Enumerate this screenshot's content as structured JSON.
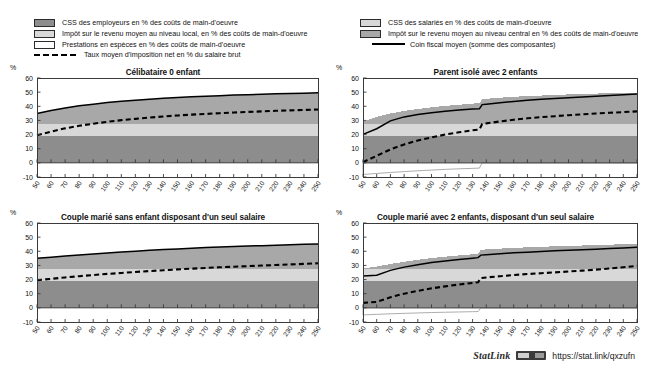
{
  "legend_left": {
    "items": [
      {
        "key": "dark-gray-swatch",
        "label": "CSS des employeurs en % des coûts de main-d'oeuvre"
      },
      {
        "key": "light-gray-swatch",
        "label": "Impôt sur le revenu moyen au niveau local, en % des coûts de main-d'oeuvre"
      },
      {
        "key": "white-swatch",
        "label": "Prestations en espèces en % des coûts de main-d'oeuvre"
      },
      {
        "key": "dashed-line",
        "label": "Taux moyen d'imposition net en % du salaire brut"
      }
    ]
  },
  "legend_right": {
    "items": [
      {
        "key": "light-gray-swatch",
        "label": "CSS des salariés en % des coûts de main-d'oeuvre"
      },
      {
        "key": "mid-gray-swatch",
        "label": "Impôt sur le revenu moyen au niveau central en %  des coûts de main-d'oeuvre"
      },
      {
        "key": "solid-line",
        "label": "Coin fiscal moyen (somme des composantes)"
      }
    ]
  },
  "footer": {
    "statlink_label": "StatLink",
    "url": "https://stat.link/qxzufn"
  },
  "colors": {
    "employer_ssc": "#8d8d8d",
    "central_income_tax": "#a8a8a8",
    "local_income_tax": "#d8d8d8",
    "employee_ssc": "#d8d8d8",
    "cash_benefits": "#ffffff",
    "net_tax_rate_line": "#000000",
    "tax_wedge_line": "#000000",
    "axis": "#3a3a3a"
  },
  "chart_data": [
    {
      "type": "area",
      "panel": "top-left",
      "title": "Célibataire 0 enfant",
      "xlabel": "",
      "ylabel": "%",
      "xlim": [
        50,
        250
      ],
      "ylim": [
        -10,
        60
      ],
      "ytick_values": [
        60,
        50,
        40,
        30,
        20,
        10,
        0,
        -10
      ],
      "x": [
        50,
        60,
        70,
        80,
        90,
        100,
        110,
        120,
        130,
        140,
        150,
        160,
        170,
        180,
        190,
        200,
        210,
        220,
        230,
        240,
        250
      ],
      "grid": false,
      "legend_position": "top",
      "series": [
        {
          "name": "CSS des employeurs en % des coûts de main-d'oeuvre",
          "values": [
            19.1,
            19.1,
            19.1,
            19.1,
            19.1,
            19.1,
            19.1,
            19.1,
            19.1,
            19.1,
            19.1,
            19.1,
            19.1,
            19.1,
            19.1,
            19.1,
            19.1,
            19.1,
            19.1,
            19.1,
            19.1
          ]
        },
        {
          "name": "CSS des salariés en % des coûts de main-d'oeuvre",
          "values": [
            8.3,
            8.3,
            8.3,
            8.3,
            8.3,
            8.3,
            8.3,
            8.3,
            8.3,
            8.3,
            8.3,
            8.3,
            8.3,
            8.3,
            8.3,
            8.3,
            8.3,
            8.3,
            8.3,
            8.3,
            8.3
          ]
        },
        {
          "name": "Impôt sur le revenu moyen au niveau central en % des coûts de main-d'oeuvre",
          "values": [
            7.5,
            9.6,
            11.4,
            12.9,
            14.1,
            15.2,
            16.1,
            16.9,
            17.6,
            18.2,
            18.8,
            19.3,
            19.7,
            20.1,
            20.5,
            20.8,
            21.1,
            21.4,
            21.7,
            21.9,
            22.1
          ]
        },
        {
          "name": "Impôt sur le revenu moyen au niveau local, en % des coûts de main-d'oeuvre",
          "values": [
            0,
            0,
            0,
            0,
            0,
            0,
            0,
            0,
            0,
            0,
            0,
            0,
            0,
            0,
            0,
            0,
            0,
            0,
            0,
            0,
            0
          ]
        },
        {
          "name": "Prestations en espèces en % des coûts de main-d'oeuvre",
          "values": [
            0,
            0,
            0,
            0,
            0,
            0,
            0,
            0,
            0,
            0,
            0,
            0,
            0,
            0,
            0,
            0,
            0,
            0,
            0,
            0,
            0
          ]
        }
      ],
      "lines": [
        {
          "name": "Coin fiscal moyen (somme des composantes)",
          "style": "solid",
          "values": [
            34.9,
            37.0,
            38.8,
            40.3,
            41.5,
            42.6,
            43.5,
            44.3,
            45.0,
            45.6,
            46.2,
            46.7,
            47.1,
            47.5,
            47.9,
            48.2,
            48.5,
            48.8,
            49.1,
            49.3,
            49.5
          ]
        },
        {
          "name": "Taux moyen d'imposition net en % du salaire brut",
          "style": "dashed",
          "values": [
            19.5,
            22.1,
            24.4,
            26.2,
            27.7,
            29.0,
            30.2,
            31.1,
            32.0,
            32.8,
            33.5,
            34.1,
            34.6,
            35.1,
            35.6,
            36.0,
            36.4,
            36.8,
            37.1,
            37.4,
            37.7
          ]
        }
      ]
    },
    {
      "type": "area",
      "panel": "top-right",
      "title": "Parent isolé avec 2 enfants",
      "xlabel": "",
      "ylabel": "%",
      "xlim": [
        50,
        250
      ],
      "ylim": [
        -10,
        60
      ],
      "ytick_values": [
        60,
        50,
        40,
        30,
        20,
        10,
        0,
        -10
      ],
      "x": [
        50,
        60,
        70,
        80,
        90,
        100,
        110,
        120,
        130,
        135,
        137,
        140,
        150,
        160,
        170,
        180,
        190,
        200,
        210,
        220,
        230,
        240,
        250
      ],
      "grid": false,
      "legend_position": "top",
      "series": [
        {
          "name": "CSS des employeurs en % des coûts de main-d'oeuvre",
          "values": [
            19.1,
            19.1,
            19.1,
            19.1,
            19.1,
            19.1,
            19.1,
            19.1,
            19.1,
            19.1,
            19.1,
            19.1,
            19.1,
            19.1,
            19.1,
            19.1,
            19.1,
            19.1,
            19.1,
            19.1,
            19.1,
            19.1,
            19.1
          ]
        },
        {
          "name": "CSS des salariés en % des coûts de main-d'oeuvre",
          "values": [
            8.3,
            8.3,
            8.3,
            8.3,
            8.3,
            8.3,
            8.3,
            8.3,
            8.3,
            8.3,
            8.3,
            8.3,
            8.3,
            8.3,
            8.3,
            8.3,
            8.3,
            8.3,
            8.3,
            8.3,
            8.3,
            8.3,
            8.3
          ]
        },
        {
          "name": "Impôt sur le revenu moyen au niveau central en % des coûts de main-d'oeuvre",
          "values": [
            1.6,
            5.2,
            7.5,
            9.3,
            10.7,
            11.9,
            12.9,
            13.7,
            14.5,
            14.8,
            17.5,
            17.9,
            18.7,
            19.3,
            19.8,
            20.2,
            20.6,
            21.0,
            21.3,
            21.6,
            21.8,
            22.0,
            22.2
          ]
        },
        {
          "name": "Impôt sur le revenu moyen au niveau local, en % des coûts de main-d'oeuvre",
          "values": [
            0,
            0,
            0,
            0,
            0,
            0,
            0,
            0,
            0,
            0,
            0,
            0,
            0,
            0,
            0,
            0,
            0,
            0,
            0,
            0,
            0,
            0,
            0
          ]
        },
        {
          "name": "Prestations en espèces en % des coûts de main-d'oeuvre",
          "values": [
            -8.2,
            -7.5,
            -6.8,
            -6.2,
            -5.6,
            -5.1,
            -4.6,
            -4.2,
            -3.9,
            -3.7,
            0,
            0,
            0,
            0,
            0,
            0,
            0,
            0,
            0,
            0,
            0,
            0,
            0
          ]
        }
      ],
      "lines": [
        {
          "name": "Coin fiscal moyen (somme des composantes)",
          "style": "solid",
          "values": [
            20.1,
            24.1,
            29.7,
            32.5,
            34.2,
            35.5,
            36.5,
            37.3,
            38.0,
            38.3,
            41.2,
            41.5,
            42.5,
            43.4,
            44.2,
            44.9,
            45.5,
            46.1,
            46.6,
            47.1,
            47.6,
            48.1,
            48.6
          ]
        },
        {
          "name": "Taux moyen d'imposition net en % du salaire brut",
          "style": "dashed",
          "values": [
            0.5,
            5.0,
            9.5,
            13.0,
            15.8,
            18.0,
            20.0,
            21.6,
            23.0,
            23.6,
            27.5,
            27.9,
            29.3,
            30.5,
            31.5,
            32.3,
            33.0,
            33.7,
            34.3,
            34.9,
            35.4,
            35.9,
            36.4
          ]
        }
      ]
    },
    {
      "type": "area",
      "panel": "bottom-left",
      "title": "Couple marié sans enfant disposant d'un seul salaire",
      "xlabel": "",
      "ylabel": "%",
      "xlim": [
        50,
        250
      ],
      "ylim": [
        -10,
        60
      ],
      "ytick_values": [
        60,
        50,
        40,
        30,
        20,
        10,
        0,
        -10
      ],
      "x": [
        50,
        60,
        70,
        80,
        90,
        100,
        110,
        120,
        130,
        140,
        150,
        160,
        170,
        180,
        190,
        200,
        210,
        220,
        230,
        240,
        250
      ],
      "grid": false,
      "legend_position": "top",
      "series": [
        {
          "name": "CSS des employeurs en % des coûts de main-d'oeuvre",
          "values": [
            19.1,
            19.1,
            19.1,
            19.1,
            19.1,
            19.1,
            19.1,
            19.1,
            19.1,
            19.1,
            19.1,
            19.1,
            19.1,
            19.1,
            19.1,
            19.1,
            19.1,
            19.1,
            19.1,
            19.1,
            19.1
          ]
        },
        {
          "name": "CSS des salariés en % des coûts de main-d'oeuvre",
          "values": [
            8.3,
            8.3,
            8.3,
            8.3,
            8.3,
            8.3,
            8.3,
            8.3,
            8.3,
            8.3,
            8.3,
            8.3,
            8.3,
            8.3,
            8.3,
            8.3,
            8.3,
            8.3,
            8.3,
            8.3,
            8.3
          ]
        },
        {
          "name": "Impôt sur le revenu moyen au niveau central en % des coûts de main-d'oeuvre",
          "values": [
            7.6,
            8.4,
            9.2,
            10.0,
            10.7,
            11.4,
            12.1,
            12.7,
            13.3,
            13.8,
            14.3,
            14.8,
            15.2,
            15.6,
            16.0,
            16.3,
            16.6,
            16.9,
            17.2,
            17.5,
            17.8
          ]
        },
        {
          "name": "Impôt sur le revenu moyen au niveau local, en % des coûts de main-d'oeuvre",
          "values": [
            0,
            0,
            0,
            0,
            0,
            0,
            0,
            0,
            0,
            0,
            0,
            0,
            0,
            0,
            0,
            0,
            0,
            0,
            0,
            0,
            0
          ]
        },
        {
          "name": "Prestations en espèces en % des coûts de main-d'oeuvre",
          "values": [
            0,
            0,
            0,
            0,
            0,
            0,
            0,
            0,
            0,
            0,
            0,
            0,
            0,
            0,
            0,
            0,
            0,
            0,
            0,
            0,
            0
          ]
        }
      ],
      "lines": [
        {
          "name": "Coin fiscal moyen (somme des composantes)",
          "style": "solid",
          "values": [
            35.0,
            35.8,
            36.6,
            37.4,
            38.1,
            38.8,
            39.5,
            40.1,
            40.7,
            41.2,
            41.7,
            42.2,
            42.6,
            43.0,
            43.4,
            43.7,
            44.0,
            44.3,
            44.6,
            44.9,
            45.2
          ]
        },
        {
          "name": "Taux moyen d'imposition net en % du salaire brut",
          "style": "dashed",
          "values": [
            19.6,
            20.5,
            21.5,
            22.4,
            23.2,
            24.0,
            24.7,
            25.4,
            26.0,
            26.6,
            27.2,
            27.7,
            28.2,
            28.7,
            29.1,
            29.5,
            29.9,
            30.3,
            30.7,
            31.1,
            31.5
          ]
        }
      ]
    },
    {
      "type": "area",
      "panel": "bottom-right",
      "title": "Couple marié avec 2 enfants, disposant d'un seul salaire",
      "xlabel": "",
      "ylabel": "%",
      "xlim": [
        50,
        250
      ],
      "ylim": [
        -10,
        60
      ],
      "ytick_values": [
        60,
        50,
        40,
        30,
        20,
        10,
        0,
        -10
      ],
      "x": [
        50,
        60,
        70,
        80,
        90,
        100,
        110,
        120,
        130,
        134,
        136,
        140,
        150,
        160,
        170,
        180,
        190,
        200,
        210,
        220,
        230,
        240,
        250
      ],
      "grid": false,
      "legend_position": "top",
      "series": [
        {
          "name": "CSS des employeurs en % des coûts de main-d'oeuvre",
          "values": [
            19.1,
            19.1,
            19.1,
            19.1,
            19.1,
            19.1,
            19.1,
            19.1,
            19.1,
            19.1,
            19.1,
            19.1,
            19.1,
            19.1,
            19.1,
            19.1,
            19.1,
            19.1,
            19.1,
            19.1,
            19.1,
            19.1,
            19.1
          ]
        },
        {
          "name": "CSS des salariés en % des coûts de main-d'oeuvre",
          "values": [
            8.3,
            8.3,
            8.3,
            8.3,
            8.3,
            8.3,
            8.3,
            8.3,
            8.3,
            8.3,
            8.3,
            8.3,
            8.3,
            8.3,
            8.3,
            8.3,
            8.3,
            8.3,
            8.3,
            8.3,
            8.3,
            8.3,
            8.3
          ]
        },
        {
          "name": "Impôt sur le revenu moyen au niveau central en % des coûts de main-d'oeuvre",
          "values": [
            0.5,
            1.8,
            3.6,
            5.2,
            6.6,
            7.8,
            8.8,
            9.7,
            10.5,
            10.8,
            13.6,
            13.9,
            14.5,
            15.0,
            15.4,
            15.8,
            16.1,
            16.4,
            16.7,
            17.0,
            17.3,
            17.6,
            17.9
          ]
        },
        {
          "name": "Impôt sur le revenu moyen au niveau local, en % des coûts de main-d'oeuvre",
          "values": [
            0,
            0,
            0,
            0,
            0,
            0,
            0,
            0,
            0,
            0,
            0,
            0,
            0,
            0,
            0,
            0,
            0,
            0,
            0,
            0,
            0,
            0,
            0
          ]
        },
        {
          "name": "Prestations en espèces en % des coûts de main-d'oeuvre",
          "values": [
            -5.0,
            -4.6,
            -4.2,
            -3.9,
            -3.6,
            -3.3,
            -3.1,
            -2.9,
            -2.7,
            -2.6,
            0,
            0,
            0,
            0,
            0,
            0,
            0,
            0,
            0,
            0,
            0,
            0,
            0
          ]
        }
      ],
      "lines": [
        {
          "name": "Coin fiscal moyen (somme des composantes)",
          "style": "solid",
          "values": [
            22.5,
            23.0,
            26.5,
            28.8,
            30.5,
            32.0,
            33.2,
            34.2,
            35.1,
            35.5,
            37.3,
            37.6,
            38.3,
            38.9,
            39.4,
            39.9,
            40.3,
            40.7,
            41.1,
            41.5,
            41.9,
            42.4,
            42.9
          ]
        },
        {
          "name": "Taux moyen d'imposition net en % du salaire brut",
          "style": "dashed",
          "values": [
            3.5,
            4.2,
            7.5,
            10.0,
            12.0,
            13.8,
            15.2,
            16.5,
            17.6,
            18.1,
            21.1,
            21.5,
            22.4,
            23.2,
            23.9,
            24.5,
            25.1,
            25.7,
            26.3,
            27.0,
            27.8,
            28.7,
            29.7
          ]
        }
      ]
    }
  ]
}
